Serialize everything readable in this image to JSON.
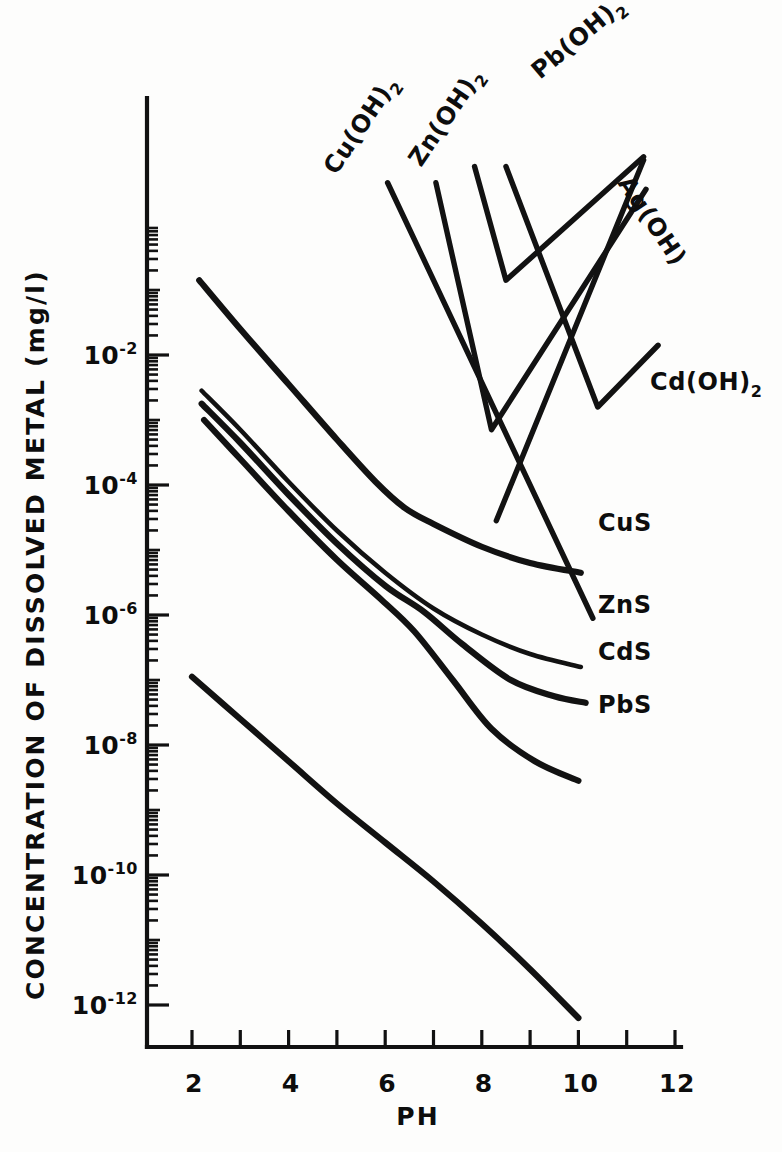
{
  "chart_data": {
    "type": "line",
    "title": "",
    "xlabel": "PH",
    "ylabel": "CONCENTRATION OF DISSOLVED METAL (mg/l)",
    "xlim": [
      1.3,
      12.3
    ],
    "ylim": [
      -12.6,
      -0.6
    ],
    "yscale": "log",
    "grid": false,
    "legend_position": "inline-right",
    "xticks": [
      2,
      3,
      4,
      5,
      6,
      7,
      8,
      9,
      10,
      11,
      12
    ],
    "xtick_labels": [
      "2",
      "",
      "4",
      "",
      "6",
      "",
      "8",
      "",
      "10",
      "",
      "12"
    ],
    "ytick_exponents": [
      -2,
      -4,
      -6,
      -8,
      -10,
      -12
    ],
    "ytick_labels": [
      "10",
      "10",
      "10",
      "10",
      "10",
      "10"
    ],
    "ytick_exponent_labels": [
      "-2",
      "-4",
      "-6",
      "-8",
      "-10",
      "-12"
    ],
    "series": [
      {
        "name": "CuS",
        "label": "CuS",
        "label_sub": "",
        "style": "thick",
        "points": [
          [
            2.15,
            -0.85
          ],
          [
            3.0,
            -1.6
          ],
          [
            4.0,
            -2.45
          ],
          [
            5.0,
            -3.3
          ],
          [
            5.8,
            -3.95
          ],
          [
            6.4,
            -4.35
          ],
          [
            7.0,
            -4.6
          ],
          [
            8.0,
            -4.95
          ],
          [
            9.0,
            -5.2
          ],
          [
            10.05,
            -5.35
          ]
        ],
        "label_x": 598,
        "label_y": 531
      },
      {
        "name": "ZnS",
        "label": "ZnS",
        "label_sub": "",
        "style": "thin",
        "points": [
          [
            2.2,
            -2.55
          ],
          [
            3.0,
            -3.15
          ],
          [
            4.0,
            -3.95
          ],
          [
            5.0,
            -4.7
          ],
          [
            6.0,
            -5.35
          ],
          [
            7.0,
            -5.9
          ],
          [
            8.0,
            -6.3
          ],
          [
            9.0,
            -6.6
          ],
          [
            10.05,
            -6.8
          ]
        ],
        "label_x": 598,
        "label_y": 613
      },
      {
        "name": "CdS",
        "label": "CdS",
        "label_sub": "",
        "style": "thick",
        "points": [
          [
            2.2,
            -2.75
          ],
          [
            3.0,
            -3.35
          ],
          [
            4.0,
            -4.15
          ],
          [
            5.0,
            -4.9
          ],
          [
            6.0,
            -5.55
          ],
          [
            6.8,
            -5.95
          ],
          [
            7.6,
            -6.45
          ],
          [
            8.6,
            -7.0
          ],
          [
            9.5,
            -7.25
          ],
          [
            10.15,
            -7.35
          ]
        ],
        "label_x": 598,
        "label_y": 660
      },
      {
        "name": "PbS",
        "label": "PbS",
        "label_sub": "",
        "style": "thick",
        "points": [
          [
            2.25,
            -3.0
          ],
          [
            3.0,
            -3.6
          ],
          [
            4.0,
            -4.4
          ],
          [
            5.0,
            -5.15
          ],
          [
            5.9,
            -5.75
          ],
          [
            6.6,
            -6.25
          ],
          [
            7.4,
            -7.0
          ],
          [
            8.2,
            -7.75
          ],
          [
            9.1,
            -8.25
          ],
          [
            10.0,
            -8.55
          ]
        ],
        "label_x": 598,
        "label_y": 713
      },
      {
        "name": "AgS",
        "label": "",
        "label_sub": "",
        "style": "thick",
        "points": [
          [
            2.0,
            -6.95
          ],
          [
            3.0,
            -7.6
          ],
          [
            4.0,
            -8.25
          ],
          [
            5.0,
            -8.9
          ],
          [
            6.0,
            -9.5
          ],
          [
            7.0,
            -10.1
          ],
          [
            8.0,
            -10.75
          ],
          [
            9.0,
            -11.45
          ],
          [
            10.0,
            -12.2
          ]
        ],
        "label_x": 0,
        "label_y": 0
      },
      {
        "name": "Cu(OH)2",
        "label": "Cu(OH)",
        "label_sub": "2",
        "style": "hydroxide",
        "points": [
          [
            6.05,
            0.65
          ],
          [
            10.3,
            -6.05
          ]
        ],
        "label_x": 336,
        "label_y": 176,
        "label_rotate": -56
      },
      {
        "name": "Zn(OH)2",
        "label": "Zn(OH)",
        "label_sub": "2",
        "style": "hydroxide",
        "points": [
          [
            7.05,
            0.65
          ],
          [
            8.2,
            -3.15
          ],
          [
            11.4,
            0.55
          ]
        ],
        "label_x": 421,
        "label_y": 168,
        "label_rotate": -56
      },
      {
        "name": "Pb(OH)2",
        "label": "Pb(OH)",
        "label_sub": "2",
        "style": "hydroxide",
        "points": [
          [
            7.85,
            0.9
          ],
          [
            8.5,
            -0.85
          ],
          [
            11.35,
            1.05
          ]
        ],
        "label_x": 540,
        "label_y": 80,
        "label_rotate": -40
      },
      {
        "name": "Cd(OH)2",
        "label": "Cd(OH)",
        "label_sub": "2",
        "style": "hydroxide",
        "points": [
          [
            8.5,
            0.9
          ],
          [
            10.4,
            -2.8
          ],
          [
            11.65,
            -1.85
          ]
        ],
        "label_x": 650,
        "label_y": 390
      },
      {
        "name": "Ag(OH)",
        "label": "Ag(OH)",
        "label_sub": "",
        "style": "hydroxide",
        "points": [
          [
            11.35,
            1.0
          ],
          [
            8.3,
            -4.55
          ]
        ],
        "label_x": 617,
        "label_y": 183,
        "label_rotate": 56
      }
    ]
  },
  "axes": {
    "x_label": "PH",
    "y_label": "CONCENTRATION OF DISSOLVED METAL (mg/l)",
    "y_base": "10"
  }
}
